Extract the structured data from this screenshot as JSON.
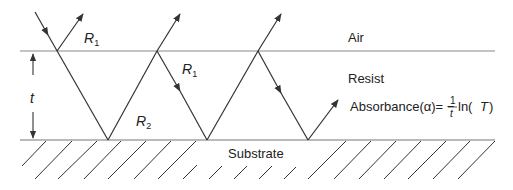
{
  "diagram": {
    "labels": {
      "air": "Air",
      "resist": "Resist",
      "substrate": "Substrate",
      "r1_top": "R",
      "r1_top_sub": "1",
      "r1_mid": "R",
      "r1_mid_sub": "1",
      "r2": "R",
      "r2_sub": "2",
      "thickness": "t",
      "formula_prefix": "Absorbance(α)= −",
      "formula_num": "1",
      "formula_den": "t",
      "formula_suffix": " ln(",
      "formula_T": "T",
      "formula_close": ")"
    },
    "colors": {
      "line": "#333333",
      "interface": "#888888",
      "text": "#222222"
    }
  }
}
